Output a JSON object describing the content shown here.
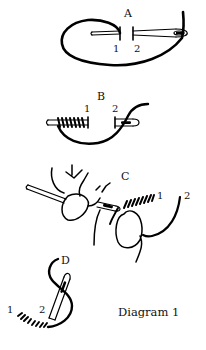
{
  "diagram": {
    "caption": "Diagram 1",
    "panels": [
      {
        "id": "A",
        "label": "A",
        "points": [
          "1",
          "2"
        ]
      },
      {
        "id": "B",
        "label": "B",
        "points": [
          "1",
          "2"
        ]
      },
      {
        "id": "C",
        "label": "C",
        "points": [
          "1",
          "2"
        ]
      },
      {
        "id": "D",
        "label": "D",
        "points": [
          "1",
          "2"
        ]
      }
    ],
    "colors": {
      "ink": "#000000",
      "background": "#ffffff"
    }
  }
}
